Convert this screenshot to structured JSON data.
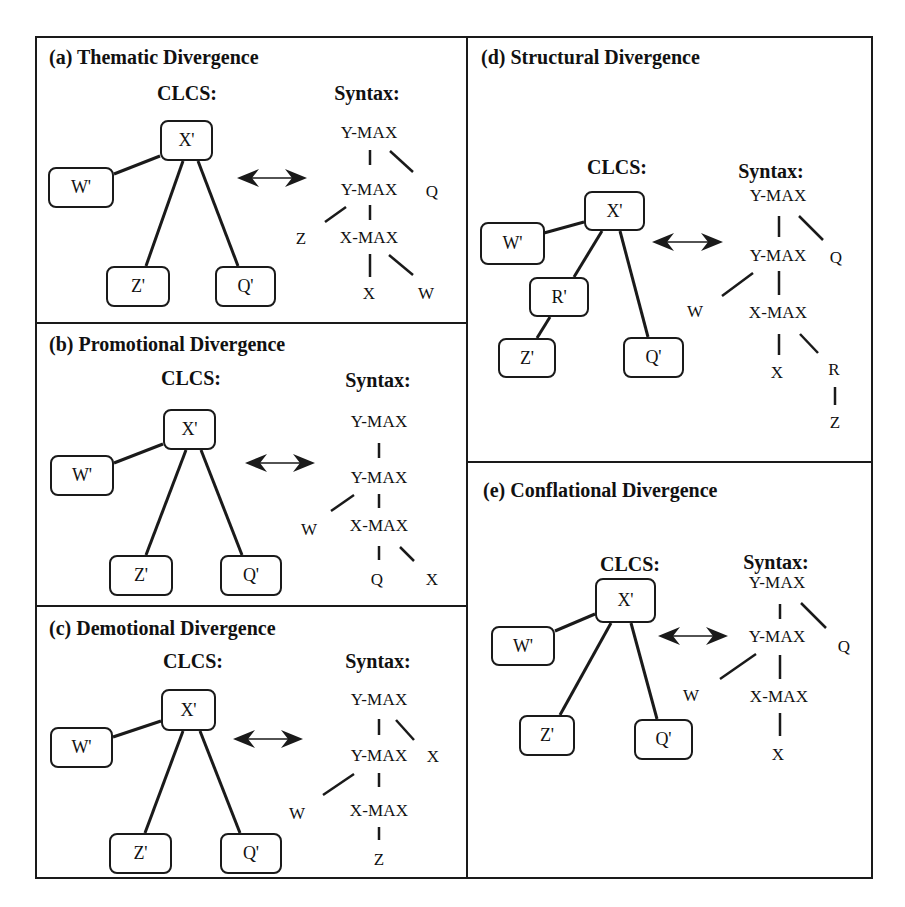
{
  "figure": {
    "frame": {
      "x": 35,
      "y": 36,
      "w": 838,
      "h": 843
    },
    "dividers": {
      "vertical": {
        "x": 467,
        "y1": 36,
        "y2": 879
      },
      "horizontal": [
        {
          "x1": 35,
          "x2": 467,
          "y": 323
        },
        {
          "x1": 35,
          "x2": 467,
          "y": 606
        },
        {
          "x1": 467,
          "x2": 873,
          "y": 462
        }
      ]
    },
    "colors": {
      "ink": "#1a1a1a",
      "background": "#ffffff"
    }
  },
  "panels": [
    {
      "id": "a",
      "title": "(a) Thematic Divergence",
      "title_pos": {
        "x": 49,
        "y": 46
      },
      "clcs_label": "CLCS:",
      "clcs_label_pos": {
        "x": 187,
        "y": 82
      },
      "syntax_label": "Syntax:",
      "syntax_label_pos": {
        "x": 367,
        "y": 82
      },
      "clcs_nodes": [
        {
          "label": "X'",
          "x": 160,
          "y": 120,
          "w": 53,
          "h": 41
        },
        {
          "label": "W'",
          "x": 48,
          "y": 167,
          "w": 66,
          "h": 41
        },
        {
          "label": "Z'",
          "x": 106,
          "y": 266,
          "w": 64,
          "h": 41
        },
        {
          "label": "Q'",
          "x": 215,
          "y": 266,
          "w": 61,
          "h": 41
        }
      ],
      "clcs_edges": [
        [
          160,
          156,
          114,
          174
        ],
        [
          183,
          161,
          146,
          266
        ],
        [
          198,
          161,
          238,
          266
        ]
      ],
      "arrow": {
        "x1": 237,
        "x2": 307,
        "y": 178
      },
      "syntax_nodes": [
        {
          "label": "Y-MAX",
          "x": 369,
          "y": 133
        },
        {
          "label": "Y-MAX",
          "x": 369,
          "y": 190
        },
        {
          "label": "Q",
          "x": 432,
          "y": 192
        },
        {
          "label": "Z",
          "x": 301,
          "y": 239
        },
        {
          "label": "X-MAX",
          "x": 369,
          "y": 238
        },
        {
          "label": "X",
          "x": 369,
          "y": 294
        },
        {
          "label": "W",
          "x": 426,
          "y": 294
        }
      ],
      "syntax_edges": [
        [
          370,
          150,
          370,
          165
        ],
        [
          390,
          151,
          413,
          172
        ],
        [
          370,
          205,
          370,
          220
        ],
        [
          346,
          207,
          325,
          222
        ],
        [
          370,
          254,
          370,
          277
        ],
        [
          389,
          255,
          413,
          275
        ]
      ]
    },
    {
      "id": "b",
      "title": "(b) Promotional Divergence",
      "title_pos": {
        "x": 49,
        "y": 333
      },
      "clcs_label": "CLCS:",
      "clcs_label_pos": {
        "x": 191,
        "y": 367
      },
      "syntax_label": "Syntax:",
      "syntax_label_pos": {
        "x": 378,
        "y": 369
      },
      "clcs_nodes": [
        {
          "label": "X'",
          "x": 163,
          "y": 409,
          "w": 53,
          "h": 41
        },
        {
          "label": "W'",
          "x": 50,
          "y": 455,
          "w": 64,
          "h": 41
        },
        {
          "label": "Z'",
          "x": 109,
          "y": 555,
          "w": 64,
          "h": 41
        },
        {
          "label": "Q'",
          "x": 220,
          "y": 555,
          "w": 62,
          "h": 41
        }
      ],
      "clcs_edges": [
        [
          163,
          444,
          114,
          463
        ],
        [
          186,
          450,
          146,
          555
        ],
        [
          201,
          450,
          242,
          555
        ]
      ],
      "arrow": {
        "x1": 245,
        "x2": 315,
        "y": 463
      },
      "syntax_nodes": [
        {
          "label": "Y-MAX",
          "x": 379,
          "y": 422
        },
        {
          "label": "Y-MAX",
          "x": 379,
          "y": 478
        },
        {
          "label": "W",
          "x": 309,
          "y": 530
        },
        {
          "label": "X-MAX",
          "x": 379,
          "y": 526
        },
        {
          "label": "Q",
          "x": 377,
          "y": 580
        },
        {
          "label": "X",
          "x": 432,
          "y": 580
        }
      ],
      "syntax_edges": [
        [
          379,
          443,
          379,
          458
        ],
        [
          379,
          494,
          379,
          508
        ],
        [
          354,
          495,
          331,
          511
        ],
        [
          379,
          546,
          379,
          560
        ],
        [
          400,
          547,
          414,
          561
        ]
      ]
    },
    {
      "id": "c",
      "title": "(c) Demotional Divergence",
      "title_pos": {
        "x": 49,
        "y": 617
      },
      "clcs_label": "CLCS:",
      "clcs_label_pos": {
        "x": 193,
        "y": 650
      },
      "syntax_label": "Syntax:",
      "syntax_label_pos": {
        "x": 378,
        "y": 650
      },
      "clcs_nodes": [
        {
          "label": "X'",
          "x": 161,
          "y": 689,
          "w": 55,
          "h": 42
        },
        {
          "label": "W'",
          "x": 50,
          "y": 727,
          "w": 63,
          "h": 41
        },
        {
          "label": "Z'",
          "x": 109,
          "y": 833,
          "w": 63,
          "h": 41
        },
        {
          "label": "Q'",
          "x": 220,
          "y": 833,
          "w": 62,
          "h": 41
        }
      ],
      "clcs_edges": [
        [
          161,
          721,
          113,
          737
        ],
        [
          183,
          731,
          145,
          833
        ],
        [
          200,
          731,
          240,
          833
        ]
      ],
      "arrow": {
        "x1": 233,
        "x2": 303,
        "y": 739
      },
      "syntax_nodes": [
        {
          "label": "Y-MAX",
          "x": 379,
          "y": 700
        },
        {
          "label": "Y-MAX",
          "x": 379,
          "y": 756
        },
        {
          "label": "X",
          "x": 433,
          "y": 757
        },
        {
          "label": "W",
          "x": 297,
          "y": 814
        },
        {
          "label": "X-MAX",
          "x": 379,
          "y": 811
        },
        {
          "label": "Z",
          "x": 379,
          "y": 860
        }
      ],
      "syntax_edges": [
        [
          379,
          719,
          379,
          735
        ],
        [
          396,
          720,
          414,
          740
        ],
        [
          379,
          773,
          379,
          787
        ],
        [
          354,
          774,
          323,
          795
        ],
        [
          379,
          827,
          379,
          840
        ]
      ]
    },
    {
      "id": "d",
      "title": "(d) Structural Divergence",
      "title_pos": {
        "x": 481,
        "y": 46
      },
      "clcs_label": "CLCS:",
      "clcs_label_pos": {
        "x": 617,
        "y": 156
      },
      "syntax_label": "Syntax:",
      "syntax_label_pos": {
        "x": 771,
        "y": 160
      },
      "clcs_nodes": [
        {
          "label": "X'",
          "x": 584,
          "y": 191,
          "w": 61,
          "h": 40
        },
        {
          "label": "W'",
          "x": 480,
          "y": 222,
          "w": 65,
          "h": 43
        },
        {
          "label": "R'",
          "x": 529,
          "y": 277,
          "w": 60,
          "h": 40
        },
        {
          "label": "Z'",
          "x": 498,
          "y": 338,
          "w": 58,
          "h": 40
        },
        {
          "label": "Q'",
          "x": 623,
          "y": 337,
          "w": 61,
          "h": 41
        }
      ],
      "clcs_edges": [
        [
          584,
          222,
          544,
          233
        ],
        [
          602,
          231,
          574,
          277
        ],
        [
          620,
          231,
          648,
          337
        ],
        [
          550,
          317,
          537,
          338
        ]
      ],
      "arrow": {
        "x1": 652,
        "x2": 723,
        "y": 242
      },
      "syntax_nodes": [
        {
          "label": "Y-MAX",
          "x": 778,
          "y": 196
        },
        {
          "label": "Y-MAX",
          "x": 778,
          "y": 256
        },
        {
          "label": "Q",
          "x": 836,
          "y": 258
        },
        {
          "label": "W",
          "x": 695,
          "y": 312
        },
        {
          "label": "X-MAX",
          "x": 778,
          "y": 313
        },
        {
          "label": "X",
          "x": 777,
          "y": 373
        },
        {
          "label": "R",
          "x": 834,
          "y": 370
        },
        {
          "label": "Z",
          "x": 835,
          "y": 423
        }
      ],
      "syntax_edges": [
        [
          779,
          216,
          779,
          237
        ],
        [
          799,
          216,
          823,
          240
        ],
        [
          779,
          271,
          779,
          295
        ],
        [
          753,
          273,
          722,
          296
        ],
        [
          779,
          334,
          779,
          355
        ],
        [
          800,
          334,
          818,
          353
        ],
        [
          835,
          387,
          835,
          405
        ]
      ]
    },
    {
      "id": "e",
      "title": "(e) Conflational Divergence",
      "title_pos": {
        "x": 483,
        "y": 479
      },
      "clcs_label": "CLCS:",
      "clcs_label_pos": {
        "x": 630,
        "y": 553
      },
      "syntax_label": "Syntax:",
      "syntax_label_pos": {
        "x": 776,
        "y": 551
      },
      "clcs_nodes": [
        {
          "label": "X'",
          "x": 595,
          "y": 578,
          "w": 61,
          "h": 45
        },
        {
          "label": "W'",
          "x": 491,
          "y": 626,
          "w": 64,
          "h": 40
        },
        {
          "label": "Z'",
          "x": 519,
          "y": 715,
          "w": 56,
          "h": 41
        },
        {
          "label": "Q'",
          "x": 634,
          "y": 719,
          "w": 59,
          "h": 41
        }
      ],
      "clcs_edges": [
        [
          595,
          614,
          555,
          631
        ],
        [
          611,
          623,
          560,
          715
        ],
        [
          631,
          623,
          657,
          719
        ]
      ],
      "arrow": {
        "x1": 658,
        "x2": 728,
        "y": 636
      },
      "syntax_nodes": [
        {
          "label": "Y-MAX",
          "x": 777,
          "y": 583
        },
        {
          "label": "Y-MAX",
          "x": 777,
          "y": 637
        },
        {
          "label": "Q",
          "x": 844,
          "y": 647
        },
        {
          "label": "W",
          "x": 691,
          "y": 696
        },
        {
          "label": "X-MAX",
          "x": 779,
          "y": 697
        },
        {
          "label": "X",
          "x": 778,
          "y": 755
        }
      ],
      "syntax_edges": [
        [
          780,
          604,
          780,
          619
        ],
        [
          801,
          603,
          826,
          628
        ],
        [
          780,
          655,
          780,
          679
        ],
        [
          756,
          654,
          720,
          679
        ],
        [
          780,
          713,
          780,
          736
        ]
      ]
    }
  ]
}
